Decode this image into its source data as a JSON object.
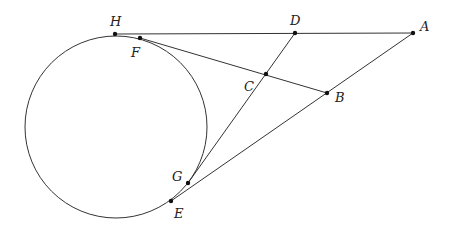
{
  "diagram": {
    "type": "geometry",
    "stroke_color": "#333333",
    "circle": {
      "cx": 116,
      "cy": 127,
      "r": 91
    },
    "points": [
      {
        "name": "H",
        "x": 115,
        "y": 34,
        "lx": 110,
        "ly": 15
      },
      {
        "name": "F",
        "x": 140,
        "y": 38,
        "lx": 131,
        "ly": 46
      },
      {
        "name": "D",
        "x": 295,
        "y": 33,
        "lx": 290,
        "ly": 14
      },
      {
        "name": "A",
        "x": 413,
        "y": 33,
        "lx": 420,
        "ly": 20
      },
      {
        "name": "C",
        "x": 266,
        "y": 74,
        "lx": 244,
        "ly": 80
      },
      {
        "name": "B",
        "x": 327,
        "y": 93,
        "lx": 335,
        "ly": 91
      },
      {
        "name": "G",
        "x": 188,
        "y": 183,
        "lx": 172,
        "ly": 170
      },
      {
        "name": "E",
        "x": 171,
        "y": 201,
        "lx": 174,
        "ly": 207
      }
    ],
    "segments": [
      [
        "H",
        "A"
      ],
      [
        "A",
        "E"
      ],
      [
        "F",
        "B"
      ],
      [
        "D",
        "G"
      ]
    ]
  }
}
